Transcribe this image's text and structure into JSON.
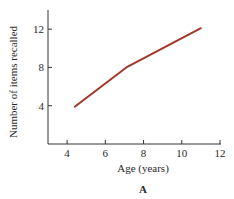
{
  "chart_data": {
    "type": "line",
    "title": "",
    "panel_label": "A",
    "xlabel": "Age (years)",
    "ylabel": "Number of items recalled",
    "xlim": [
      3,
      12
    ],
    "ylim": [
      0,
      14
    ],
    "xticks": [
      4,
      6,
      8,
      10,
      12
    ],
    "yticks": [
      4,
      8,
      12
    ],
    "grid": false,
    "legend": "none",
    "series": [
      {
        "name": "Items recalled",
        "color": "#a0382a",
        "x": [
          4.4,
          7.1,
          11.0
        ],
        "y": [
          3.9,
          8.0,
          12.1
        ]
      }
    ]
  }
}
